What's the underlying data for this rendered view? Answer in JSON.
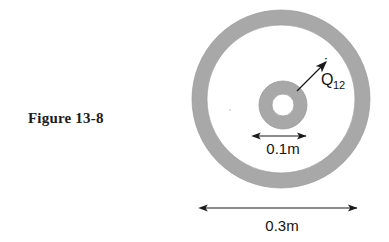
{
  "figure": {
    "caption": "Figure 13-8"
  },
  "diagram": {
    "heat_flow_label": {
      "symbol": "Q",
      "subscript": "12",
      "overdot": "˙",
      "name": "heat-transfer-rate"
    },
    "dimensions": [
      {
        "id": "inner-diameter",
        "label": "0.1m",
        "value": 0.1,
        "unit": "m",
        "describes": "inner-cylinder-diameter"
      },
      {
        "id": "outer-diameter",
        "label": "0.3m",
        "value": 0.3,
        "unit": "m",
        "describes": "outer-cylinder-diameter"
      }
    ],
    "colors": {
      "ring_fill": "#a8a8a8",
      "ring_stroke": "#8f8f8f",
      "interior": "#ffffff",
      "line": "#1a1a1a",
      "text": "#141414"
    },
    "geometry": {
      "outer_ring": {
        "cx": 281,
        "cy": 99,
        "outer_radius": 89,
        "inner_radius": 74
      },
      "inner_ring": {
        "cx": 283,
        "cy": 105,
        "outer_radius": 24,
        "inner_radius": 11
      }
    }
  }
}
